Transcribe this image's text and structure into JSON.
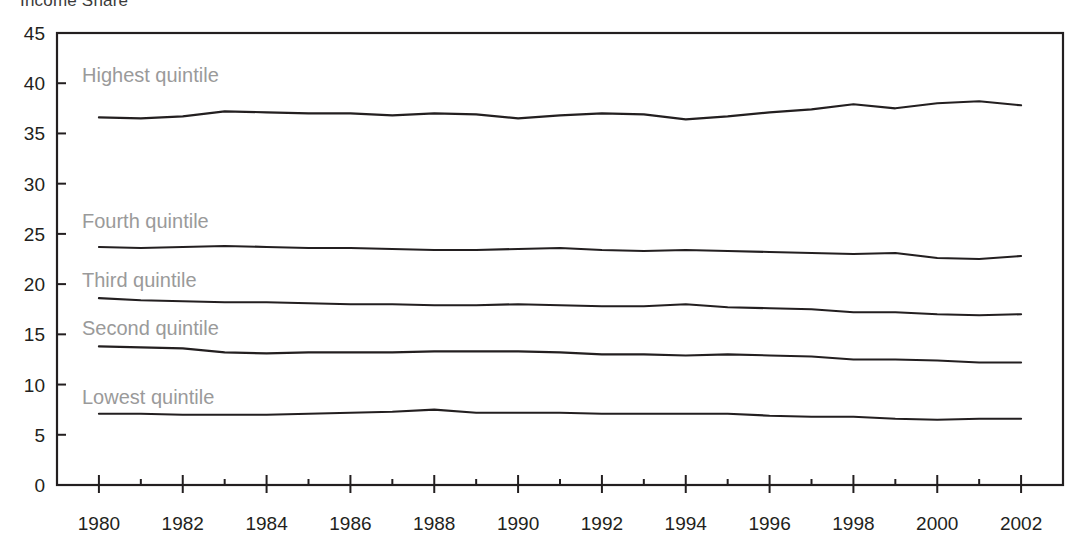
{
  "title": "Income Share",
  "axes": {
    "y_ticks": [
      "0",
      "5",
      "10",
      "15",
      "20",
      "25",
      "30",
      "35",
      "40",
      "45"
    ],
    "x_ticks": [
      "1980",
      "1982",
      "1984",
      "1986",
      "1988",
      "1990",
      "1992",
      "1994",
      "1996",
      "1998",
      "2000",
      "2002"
    ],
    "ylabel": "",
    "xlabel": ""
  },
  "colors": {
    "line": "#231f20",
    "series_label": "#9a9a9a",
    "axis": "#231f20",
    "background": "#ffffff"
  },
  "series_labels": {
    "highest": "Highest quintile",
    "fourth": "Fourth quintile",
    "third": "Third quintile",
    "second": "Second quintile",
    "lowest": "Lowest quintile"
  },
  "chart_data": {
    "type": "line",
    "title": "Income Share",
    "xlabel": "",
    "ylabel": "",
    "xlim": [
      1979,
      2003
    ],
    "ylim": [
      0,
      45
    ],
    "grid": false,
    "legend": "inline-labels",
    "x": [
      1980,
      1981,
      1982,
      1983,
      1984,
      1985,
      1986,
      1987,
      1988,
      1989,
      1990,
      1991,
      1992,
      1993,
      1994,
      1995,
      1996,
      1997,
      1998,
      1999,
      2000,
      2001,
      2002
    ],
    "series": [
      {
        "name": "Highest quintile",
        "values": [
          36.6,
          36.5,
          36.7,
          37.2,
          37.1,
          37.0,
          37.0,
          36.8,
          37.0,
          36.9,
          36.5,
          36.8,
          37.0,
          36.9,
          36.4,
          36.7,
          37.1,
          37.4,
          37.9,
          37.5,
          38.0,
          38.2,
          37.8
        ]
      },
      {
        "name": "Fourth quintile",
        "values": [
          23.7,
          23.6,
          23.7,
          23.8,
          23.7,
          23.6,
          23.6,
          23.5,
          23.4,
          23.4,
          23.5,
          23.6,
          23.4,
          23.3,
          23.4,
          23.3,
          23.2,
          23.1,
          23.0,
          23.1,
          22.6,
          22.5,
          22.8
        ]
      },
      {
        "name": "Third quintile",
        "values": [
          18.6,
          18.4,
          18.3,
          18.2,
          18.2,
          18.1,
          18.0,
          18.0,
          17.9,
          17.9,
          18.0,
          17.9,
          17.8,
          17.8,
          18.0,
          17.7,
          17.6,
          17.5,
          17.2,
          17.2,
          17.0,
          16.9,
          17.0
        ]
      },
      {
        "name": "Second quintile",
        "values": [
          13.8,
          13.7,
          13.6,
          13.2,
          13.1,
          13.2,
          13.2,
          13.2,
          13.3,
          13.3,
          13.3,
          13.2,
          13.0,
          13.0,
          12.9,
          13.0,
          12.9,
          12.8,
          12.5,
          12.5,
          12.4,
          12.2,
          12.2
        ]
      },
      {
        "name": "Lowest quintile",
        "values": [
          7.1,
          7.1,
          7.0,
          7.0,
          7.0,
          7.1,
          7.2,
          7.3,
          7.5,
          7.2,
          7.2,
          7.2,
          7.1,
          7.1,
          7.1,
          7.1,
          6.9,
          6.8,
          6.8,
          6.6,
          6.5,
          6.6,
          6.6
        ]
      }
    ]
  }
}
